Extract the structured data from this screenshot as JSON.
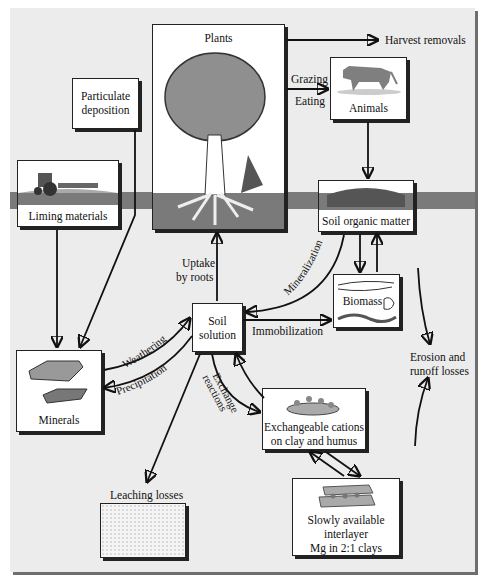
{
  "diagram": {
    "nodes": {
      "plants": "Plants",
      "particulate": [
        "Particulate",
        "deposition"
      ],
      "harvest": "Harvest removals",
      "animals": "Animals",
      "liming": "Liming materials",
      "soil_organic": "Soil organic matter",
      "biomass": "Biomass",
      "soil_solution": [
        "Soil",
        "solution"
      ],
      "minerals": "Minerals",
      "exchangeable": [
        "Exchangeable cations",
        "on clay and humus"
      ],
      "slowly": [
        "Slowly available",
        "interlayer",
        "Mg in 2:1 clays"
      ],
      "leaching": "Leaching losses",
      "erosion": [
        "Erosion and",
        "runoff losses"
      ]
    },
    "edges": {
      "grazing": "Grazing",
      "eating": "Eating",
      "uptake": [
        "Uptake",
        "by roots"
      ],
      "mineralization": "Mineralization",
      "immobilization": "Immobilization",
      "weathering": "Weathering",
      "precipitation": "Precipitation",
      "exchange": [
        "Exchange",
        "reactions"
      ]
    }
  }
}
